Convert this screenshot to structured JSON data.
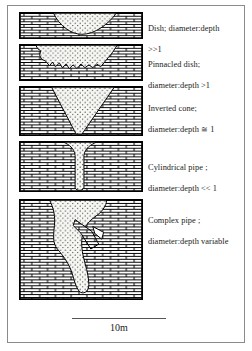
{
  "figure": {
    "background_color": "#ffffff",
    "border_color": "#8a8a8a",
    "rock_fill_pattern": "brick-masonry",
    "sediment_fill_pattern": "stipple-dots"
  },
  "panels": [
    {
      "id": "dish",
      "shape": "dish",
      "label": "Dish; diameter:depth\n>>1",
      "label_line1": "Dish; diameter:depth",
      "label_line2": ">>1",
      "ratio_text": ">>1",
      "name_text": "Dish"
    },
    {
      "id": "pinnacled-dish",
      "shape": "pinnacled-dish",
      "label": "Pinnacled dish;\ndiameter:depth >1",
      "label_line1": "Pinnacled dish;",
      "label_line2": "diameter:depth >1",
      "ratio_text": ">1",
      "name_text": "Pinnacled dish"
    },
    {
      "id": "inverted-cone",
      "shape": "inverted-cone",
      "label": "Inverted cone;\ndiameter:depth ≅ 1",
      "label_line1": "Inverted cone;",
      "label_line2": "diameter:depth ≅ 1",
      "ratio_text": "≅ 1",
      "name_text": "Inverted cone"
    },
    {
      "id": "cylindrical-pipe",
      "shape": "cylindrical-pipe",
      "label": "Cylindrical pipe ;\ndiameter:depth << 1",
      "label_line1": "Cylindrical pipe ;",
      "label_line2": "diameter:depth << 1",
      "ratio_text": "<< 1",
      "name_text": "Cylindrical pipe"
    },
    {
      "id": "complex-pipe",
      "shape": "complex-pipe",
      "label": "Complex pipe ;\ndiameter:depth  variable",
      "label_line1": "Complex pipe ;",
      "label_line2": "diameter:depth  variable",
      "ratio_text": "variable",
      "name_text": "Complex pipe"
    }
  ],
  "scalebar": {
    "label": "10m",
    "length_px": 94
  }
}
